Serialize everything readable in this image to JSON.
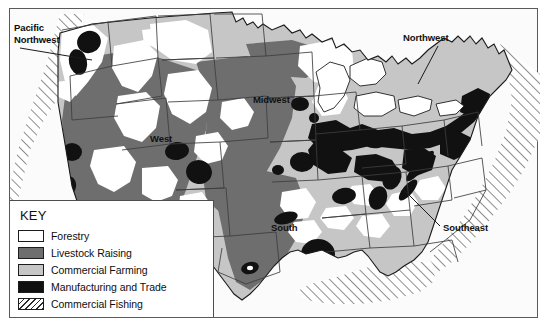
{
  "map": {
    "title": "United States Economic Activity Map",
    "regions": [
      {
        "id": "pacific-northwest",
        "label": "Pacific\nNorthwest"
      },
      {
        "id": "northwest",
        "label": "Northwest"
      },
      {
        "id": "southeast",
        "label": "Southeast"
      },
      {
        "id": "west",
        "label": "West"
      },
      {
        "id": "midwest",
        "label": "Midwest"
      },
      {
        "id": "south",
        "label": "South"
      }
    ]
  },
  "legend": {
    "title": "KEY",
    "items": [
      {
        "label": "Forestry",
        "color": "#ffffff",
        "pattern": "solid"
      },
      {
        "label": "Livestock Raising",
        "color": "#6e6e6e",
        "pattern": "solid"
      },
      {
        "label": "Commercial Farming",
        "color": "#c6c6c6",
        "pattern": "solid"
      },
      {
        "label": "Manufacturing and Trade",
        "color": "#101010",
        "pattern": "solid"
      },
      {
        "label": "Commercial Fishing",
        "color": "#ffffff",
        "pattern": "diagonal-hatch"
      }
    ]
  },
  "colors": {
    "forestry": "#ffffff",
    "livestock": "#6e6e6e",
    "farming": "#c6c6c6",
    "manufacturing": "#101010",
    "fishing_hatch": "#2b2b2b",
    "background": "#fbfbfb",
    "frame_border": "#5a5a5a",
    "coastline": "#1a1a1a",
    "state_border": "#3d3d3d"
  }
}
